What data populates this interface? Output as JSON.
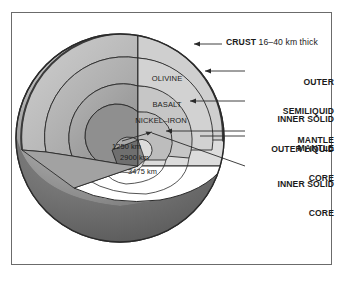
{
  "figure": {
    "frame_border_color": "#6b6b6b",
    "background_color": "#ffffff"
  },
  "callouts": {
    "crust": {
      "keyword": "CRUST",
      "detail": " 16–40 km thick"
    },
    "outer_semiliquid_mantle": {
      "line1": "OUTER",
      "line2": "SEMILIQUID",
      "line3": "MANTLE"
    },
    "inner_solid_mantle": {
      "line1": "INNER SOLID",
      "line2": "MANTLE"
    },
    "outer_liquid_core": {
      "line1": "OUTER LIQUID",
      "line2": "CORE"
    },
    "inner_solid_core": {
      "line1": "INNER SOLID",
      "line2": "CORE"
    }
  },
  "interior_labels": {
    "olivine_basalt": {
      "line1": "OLIVINE",
      "line2": "BASALT"
    },
    "nickel_iron": "NICKEL–IRON"
  },
  "depth_labels": [
    {
      "value": "1250 km"
    },
    {
      "value": "2900 km"
    },
    {
      "value": "3475 km"
    }
  ],
  "colors": {
    "sphere_lower_dark": "#6d6d6d",
    "sphere_surface_mid": "#9a9a9a",
    "sphere_highlight": "#d8d8d8",
    "crust_rim": "#3b3b3b",
    "mantle_outer_face": "#dcdcdc",
    "mantle_inner_face": "#cfcfcf",
    "core_outer_face": "#bdbdbd",
    "core_inner_face": "#8f8f8f",
    "cut_white": "#ffffff",
    "wedge_side_dark": "#808080",
    "outline": "#2a2a2a",
    "text": "#1b1b1b"
  }
}
